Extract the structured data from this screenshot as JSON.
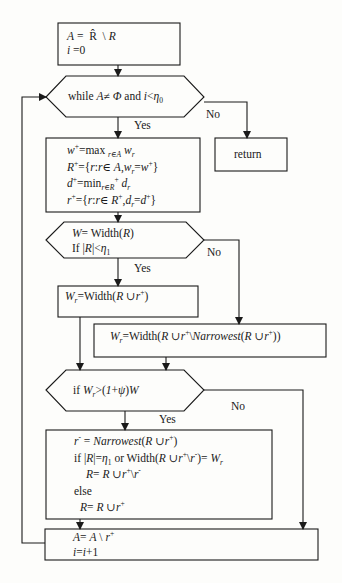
{
  "diagram": {
    "type": "flowchart",
    "colors": {
      "stroke": "#1a1a1a",
      "background": "#fdfdfb"
    },
    "nodes": {
      "init": {
        "shape": "rectangle",
        "lines": [
          "A = R̂ \\ R",
          "i = 0"
        ]
      },
      "while": {
        "shape": "hexagon",
        "text": "while A≠ Φ and i<η₀"
      },
      "return": {
        "shape": "rectangle",
        "text": "return"
      },
      "select": {
        "shape": "rectangle",
        "lines": [
          "w⁺=max r∈A wr",
          "R⁺={r:r∈ A,wr=w⁺}",
          "d⁺=minr∈R⁺ dr",
          "r⁺={r:r∈ R⁺,dr=d⁺}"
        ]
      },
      "width_check": {
        "shape": "hexagon",
        "lines": [
          "W= Width(R)",
          "If |R|<η₁"
        ]
      },
      "wr_add": {
        "shape": "rectangle",
        "text": "Wr=Width(R ∪r⁺)"
      },
      "wr_swap": {
        "shape": "rectangle",
        "text": "Wr=Width(R ∪r⁺\\Narrowest(R ∪r⁺))"
      },
      "compare": {
        "shape": "hexagon",
        "text": "if Wr>(1+ψ)W"
      },
      "update": {
        "shape": "rectangle",
        "lines": [
          "r⁻ = Narrowest(R ∪r⁺)",
          "if |R|=η₁ or Width(R ∪r⁺\\r⁻)= Wr",
          "R= R ∪r⁺\\r⁻",
          "else",
          "R= R ∪r⁺"
        ]
      },
      "increment": {
        "shape": "rectangle",
        "lines": [
          "A= A \\ r⁺",
          "i=i+1"
        ]
      }
    },
    "edge_labels": {
      "while_yes": "Yes",
      "while_no": "No",
      "width_yes": "Yes",
      "width_no": "No",
      "compare_yes": "Yes",
      "compare_no": "No"
    }
  }
}
